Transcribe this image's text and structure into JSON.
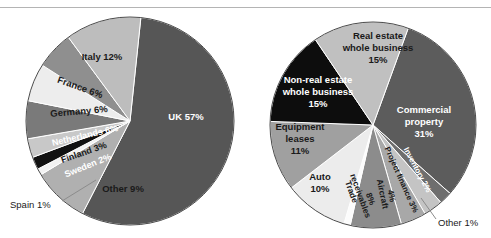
{
  "page": {
    "width": 491,
    "height": 238,
    "background": "#ffffff",
    "rule_color": "#b4b4b4"
  },
  "chart_data": [
    {
      "type": "pie",
      "name": "european-securitisation-by-country",
      "title": "",
      "center": [
        130,
        121
      ],
      "radius": 104,
      "start_angle": -84,
      "direction": "clockwise",
      "categories": [
        "UK",
        "Other",
        "Spain",
        "Sweden",
        "Finland",
        "Netherlands",
        "Germany",
        "France",
        "Italy"
      ],
      "values": [
        57,
        9,
        1,
        2,
        3,
        6,
        6,
        6,
        12
      ],
      "labels": [
        {
          "text": "UK 57%",
          "x": 186,
          "y": 117,
          "color": "#ffffff",
          "size": 9.5,
          "rotate": 0,
          "anchor": "middle",
          "bold": true
        },
        {
          "text": "Other 9%",
          "x": 123,
          "y": 189,
          "color": "#1a1a1a",
          "size": 9.5,
          "rotate": 0,
          "anchor": "middle",
          "bold": true
        },
        {
          "text": "Sweden 2%",
          "x": 88,
          "y": 166,
          "color": "#ffffff",
          "size": 9,
          "rotate": -22,
          "anchor": "middle",
          "bold": true
        },
        {
          "text": "Finland 3%",
          "x": 84,
          "y": 153,
          "color": "#1a1a1a",
          "size": 9,
          "rotate": -19,
          "anchor": "middle",
          "bold": true
        },
        {
          "text": "Netherlands 6%",
          "x": 85,
          "y": 136,
          "color": "#ffffff",
          "size": 9,
          "rotate": -13,
          "anchor": "middle",
          "bold": true
        },
        {
          "text": "Germany 6%",
          "x": 79,
          "y": 112,
          "color": "#1a1a1a",
          "size": 9.5,
          "rotate": -5,
          "anchor": "middle",
          "bold": true
        },
        {
          "text": "France 6%",
          "x": 80,
          "y": 88,
          "color": "#1a1a1a",
          "size": 9.5,
          "rotate": 20,
          "anchor": "middle",
          "bold": true
        },
        {
          "text": "Italy 12%",
          "x": 102,
          "y": 57,
          "color": "#1a1a1a",
          "size": 9.5,
          "rotate": 0,
          "anchor": "middle",
          "bold": true
        }
      ],
      "callouts": [
        {
          "text": "Spain 1%",
          "x": 10,
          "y": 205,
          "anchor": "start",
          "color": "#1a1a1a",
          "size": 9.5,
          "leader": [
            [
              62,
              201
            ],
            [
              96,
              180
            ]
          ]
        }
      ],
      "slice_colors": [
        "#565656",
        "#b0b0b0",
        "#f2f2f2",
        "#111111",
        "#c8c8c8",
        "#7a7a7a",
        "#ededed",
        "#8f8f8f",
        "#bdbdbd"
      ],
      "stroke": "#ffffff"
    },
    {
      "type": "pie",
      "name": "european-securitisation-by-asset-class",
      "title": "",
      "center": [
        373,
        125
      ],
      "radius": 103,
      "start_angle": -70,
      "direction": "clockwise",
      "categories": [
        "Commercial property",
        "Inventory",
        "Project finance",
        "Aircraft",
        "Trade receivables",
        "Other",
        "Auto",
        "Equipment leases",
        "Non-real estate whole business",
        "Real estate whole business"
      ],
      "values": [
        31,
        2,
        3,
        4,
        8,
        1,
        10,
        11,
        15,
        15
      ],
      "labels": [
        {
          "text": "Commercial",
          "x": 424,
          "y": 110,
          "color": "#ffffff",
          "size": 9.5,
          "rotate": 0,
          "anchor": "middle",
          "bold": true
        },
        {
          "text": "property",
          "x": 424,
          "y": 122,
          "color": "#ffffff",
          "size": 9.5,
          "rotate": 0,
          "anchor": "middle",
          "bold": true
        },
        {
          "text": "31%",
          "x": 424,
          "y": 134,
          "color": "#ffffff",
          "size": 9.5,
          "rotate": 0,
          "anchor": "middle",
          "bold": true
        },
        {
          "text": "Inventory 2%",
          "x": 417,
          "y": 170,
          "color": "#ffffff",
          "size": 8,
          "rotate": 62,
          "anchor": "middle",
          "bold": true
        },
        {
          "text": "Project finance 3%",
          "x": 401,
          "y": 180,
          "color": "#1a1a1a",
          "size": 8,
          "rotate": 66,
          "anchor": "middle",
          "bold": true
        },
        {
          "text": "Aircraft",
          "x": 382,
          "y": 194,
          "color": "#1a1a1a",
          "size": 8.5,
          "rotate": 78,
          "anchor": "middle",
          "bold": true
        },
        {
          "text": "4%",
          "x": 391,
          "y": 196,
          "color": "#1a1a1a",
          "size": 8.5,
          "rotate": 78,
          "anchor": "middle",
          "bold": true
        },
        {
          "text": "Trade",
          "x": 351,
          "y": 192,
          "color": "#1a1a1a",
          "size": 8.5,
          "rotate": 70,
          "anchor": "middle",
          "bold": true
        },
        {
          "text": "receivables",
          "x": 360,
          "y": 196,
          "color": "#1a1a1a",
          "size": 8.5,
          "rotate": 70,
          "anchor": "middle",
          "bold": true
        },
        {
          "text": "8%",
          "x": 370,
          "y": 199,
          "color": "#1a1a1a",
          "size": 8.5,
          "rotate": 70,
          "anchor": "middle",
          "bold": true
        },
        {
          "text": "Auto",
          "x": 320,
          "y": 177,
          "color": "#1a1a1a",
          "size": 9.5,
          "rotate": 0,
          "anchor": "middle",
          "bold": true
        },
        {
          "text": "10%",
          "x": 320,
          "y": 189,
          "color": "#1a1a1a",
          "size": 9.5,
          "rotate": 0,
          "anchor": "middle",
          "bold": true
        },
        {
          "text": "Equipment",
          "x": 300,
          "y": 127,
          "color": "#1a1a1a",
          "size": 9.5,
          "rotate": 0,
          "anchor": "middle",
          "bold": true
        },
        {
          "text": "leases",
          "x": 300,
          "y": 139,
          "color": "#1a1a1a",
          "size": 9.5,
          "rotate": 0,
          "anchor": "middle",
          "bold": true
        },
        {
          "text": "11%",
          "x": 300,
          "y": 151,
          "color": "#1a1a1a",
          "size": 9.5,
          "rotate": 0,
          "anchor": "middle",
          "bold": true
        },
        {
          "text": "Non-real estate",
          "x": 318,
          "y": 80,
          "color": "#ffffff",
          "size": 9.5,
          "rotate": 0,
          "anchor": "middle",
          "bold": true
        },
        {
          "text": "whole business",
          "x": 318,
          "y": 92,
          "color": "#ffffff",
          "size": 9.5,
          "rotate": 0,
          "anchor": "middle",
          "bold": true
        },
        {
          "text": "15%",
          "x": 318,
          "y": 104,
          "color": "#ffffff",
          "size": 9.5,
          "rotate": 0,
          "anchor": "middle",
          "bold": true
        },
        {
          "text": "Real estate",
          "x": 378,
          "y": 36,
          "color": "#1a1a1a",
          "size": 9.5,
          "rotate": 0,
          "anchor": "middle",
          "bold": true
        },
        {
          "text": "whole business",
          "x": 378,
          "y": 48,
          "color": "#1a1a1a",
          "size": 9.5,
          "rotate": 0,
          "anchor": "middle",
          "bold": true
        },
        {
          "text": "15%",
          "x": 378,
          "y": 60,
          "color": "#1a1a1a",
          "size": 9.5,
          "rotate": 0,
          "anchor": "middle",
          "bold": true
        }
      ],
      "callouts": [
        {
          "text": "Other 1%",
          "x": 438,
          "y": 223,
          "anchor": "start",
          "color": "#1a1a1a",
          "size": 9.5,
          "leader": [
            [
              436,
              219
            ],
            [
              421,
              198
            ]
          ]
        }
      ],
      "slice_colors": [
        "#5c5c5c",
        "#6e6e6e",
        "#c4c4c4",
        "#a8a8a8",
        "#8c8c8c",
        "#fcfcfc",
        "#ececec",
        "#a0a0a0",
        "#0d0d0d",
        "#c0c0c0"
      ],
      "stroke": "#ffffff"
    }
  ]
}
